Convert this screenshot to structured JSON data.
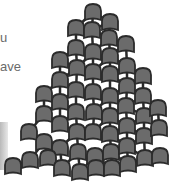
{
  "text_fragments": [
    "u",
    "ave"
  ],
  "colors": {
    "node_fill": "#6b6b6b",
    "stroke": "#2b2b2b",
    "text": "#6a6a6a"
  },
  "pyramid": {
    "nodes": [
      [
        93,
        4
      ],
      [
        110,
        14
      ],
      [
        76,
        20
      ],
      [
        92,
        22
      ],
      [
        109,
        30
      ],
      [
        76,
        40
      ],
      [
        93,
        44
      ],
      [
        110,
        48
      ],
      [
        126,
        36
      ],
      [
        60,
        52
      ],
      [
        77,
        60
      ],
      [
        93,
        64
      ],
      [
        110,
        66
      ],
      [
        127,
        58
      ],
      [
        60,
        72
      ],
      [
        76,
        82
      ],
      [
        93,
        84
      ],
      [
        110,
        88
      ],
      [
        127,
        78
      ],
      [
        143,
        68
      ],
      [
        44,
        86
      ],
      [
        60,
        94
      ],
      [
        76,
        104
      ],
      [
        94,
        104
      ],
      [
        110,
        108
      ],
      [
        126,
        98
      ],
      [
        143,
        88
      ],
      [
        44,
        106
      ],
      [
        60,
        116
      ],
      [
        77,
        124
      ],
      [
        93,
        124
      ],
      [
        110,
        126
      ],
      [
        127,
        118
      ],
      [
        144,
        108
      ],
      [
        158,
        100
      ],
      [
        29,
        124
      ],
      [
        44,
        134
      ],
      [
        60,
        140
      ],
      [
        78,
        144
      ],
      [
        95,
        148
      ],
      [
        111,
        144
      ],
      [
        127,
        138
      ],
      [
        144,
        128
      ],
      [
        159,
        120
      ],
      [
        13,
        158
      ],
      [
        30,
        152
      ],
      [
        48,
        150
      ],
      [
        62,
        160
      ],
      [
        80,
        164
      ],
      [
        96,
        160
      ],
      [
        112,
        160
      ],
      [
        128,
        156
      ],
      [
        145,
        150
      ],
      [
        160,
        148
      ]
    ]
  }
}
